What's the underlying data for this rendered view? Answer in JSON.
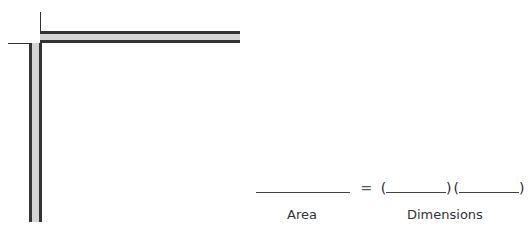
{
  "diagram": {
    "shape": "L-shaped strip (two gray bars meeting at a corner)",
    "colors": {
      "bar_fill": "#d4d4d4",
      "bar_edge": "#333333",
      "line": "#333333"
    }
  },
  "equation": {
    "equals": "=",
    "open_paren_1": "(",
    "close_paren_1": ")",
    "open_paren_2": "(",
    "close_paren_2": ")"
  },
  "labels": {
    "area": "Area",
    "dimensions": "Dimensions"
  }
}
